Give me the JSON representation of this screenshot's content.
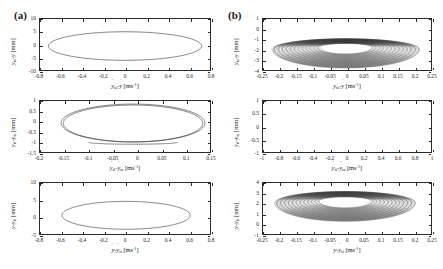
{
  "figure": {
    "top_clipped_text": "m                  n                    o",
    "panels": [
      {
        "label": "(a)",
        "id": "a"
      },
      {
        "label": "(b)",
        "id": "b"
      }
    ]
  },
  "chart_data": [
    {
      "id": "a1",
      "panel": "(a)",
      "type": "line",
      "title": "",
      "xlabel": "ẏ_ta - ẏ [ms⁻¹]",
      "ylabel": "y_ta - y [mm]",
      "xlim": [
        -0.8,
        0.8
      ],
      "ylim": [
        -10,
        10
      ],
      "xticks": [
        -0.8,
        -0.6,
        -0.4,
        -0.2,
        0,
        0.2,
        0.4,
        0.6,
        0.8
      ],
      "xticklabels": [
        "-0.8",
        "-0.6",
        "-0.4",
        "-0.2",
        "0",
        "0.2",
        "0.4",
        "0.6",
        "0.8"
      ],
      "yticks": [
        -10,
        -5,
        0,
        5,
        10
      ],
      "yticklabels": [
        "-10",
        "-5",
        "0",
        "5",
        "10"
      ],
      "grid": false,
      "legend": "none",
      "orbit": {
        "style": "single-ellipse",
        "cx": 0.0,
        "cy": -0.6,
        "rx": 0.74,
        "ry": 5.6,
        "turns": 1,
        "shrink": 1.0
      }
    },
    {
      "id": "a2",
      "panel": "(a)",
      "type": "line",
      "title": "",
      "xlabel": "ẏ_tf - ẏ_ta [ms⁻¹]",
      "ylabel": "y_tf - y_ta [mm]",
      "xlim": [
        -0.2,
        0.15
      ],
      "ylim": [
        -1.5,
        1.0
      ],
      "xticks": [
        -0.2,
        -0.15,
        -0.1,
        -0.05,
        0,
        0.05,
        0.1,
        0.15
      ],
      "xticklabels": [
        "-0.2",
        "-0.15",
        "-0.1",
        "-0.05",
        "0",
        "0.05",
        "0.1",
        "0.15"
      ],
      "yticks": [
        -1.5,
        -1,
        -0.5,
        0,
        0.5,
        1
      ],
      "yticklabels": [
        "-1.5",
        "-1",
        "-0.5",
        "0",
        "0.5",
        "1"
      ],
      "grid": false,
      "legend": "none",
      "orbit": {
        "style": "single-ellipse-flat-bottom",
        "cx": -0.008,
        "cy": -0.08,
        "rx": 0.152,
        "ry": 0.93,
        "turns": 2,
        "shrink": 0.97
      }
    },
    {
      "id": "a3",
      "panel": "(a)",
      "type": "line",
      "title": "",
      "xlabel": "ẏ - ẏ_tf [ms⁻¹]",
      "ylabel": "y - y_tf [mm]",
      "xlim": [
        -0.8,
        0.8
      ],
      "ylim": [
        -5,
        10
      ],
      "xticks": [
        -0.8,
        -0.6,
        -0.4,
        -0.2,
        0,
        0.2,
        0.4,
        0.6,
        0.8
      ],
      "xticklabels": [
        "-0.8",
        "-0.6",
        "-0.4",
        "-0.2",
        "0",
        "0.2",
        "0.4",
        "0.6",
        "0.8"
      ],
      "yticks": [
        -5,
        0,
        5,
        10
      ],
      "yticklabels": [
        "-5",
        "0",
        "5",
        "10"
      ],
      "grid": false,
      "legend": "none",
      "orbit": {
        "style": "single-ellipse",
        "cx": 0.01,
        "cy": 0.5,
        "rx": 0.62,
        "ry": 4.1,
        "turns": 1,
        "shrink": 1.0
      }
    },
    {
      "id": "b1",
      "panel": "(b)",
      "type": "line",
      "title": "",
      "xlabel": "ẏ_ta - ẏ [ms⁻¹]",
      "ylabel": "y_ta - y [mm]",
      "xlim": [
        -0.25,
        0.25
      ],
      "ylim": [
        -4,
        1
      ],
      "xticks": [
        -0.25,
        -0.2,
        -0.15,
        -0.1,
        -0.05,
        0,
        0.05,
        0.1,
        0.15,
        0.2,
        0.25
      ],
      "xticklabels": [
        "-0.25",
        "-0.2",
        "-0.15",
        "-0.1",
        "-0.05",
        "0",
        "0.05",
        "0.1",
        "0.15",
        "0.2",
        "0.25"
      ],
      "yticks": [
        -4,
        -3,
        -2,
        -1,
        0,
        1
      ],
      "yticklabels": [
        "-4",
        "-3",
        "-2",
        "-1",
        "0",
        "1"
      ],
      "grid": false,
      "legend": "none",
      "orbit": {
        "style": "nested-spiral",
        "cx": -0.004,
        "cy": -1.95,
        "rx": 0.225,
        "ry": 1.85,
        "turns": 46,
        "shrink": 0.985,
        "squash_top": 0.55
      }
    },
    {
      "id": "b2",
      "panel": "(b)",
      "type": "line",
      "title": "",
      "xlabel": "ẏ_tf - ẏ_ta [ms⁻¹]",
      "ylabel": "y_tf - y_ta [mm]",
      "xlim": [
        -1.0,
        1.0
      ],
      "ylim": [
        -1.0,
        1.0
      ],
      "xticks": [
        -1,
        -0.8,
        -0.6,
        -0.4,
        -0.2,
        0,
        0.2,
        0.4,
        0.6,
        0.8,
        1
      ],
      "xticklabels": [
        "-1",
        "-0.8",
        "-0.6",
        "-0.4",
        "-0.2",
        "0",
        "0.2",
        "0.4",
        "0.6",
        "0.8",
        "1"
      ],
      "yticks": [
        -1,
        -0.5,
        0,
        0.5,
        1
      ],
      "yticklabels": [
        "-1",
        "-0.5",
        "0",
        "0.5",
        "1"
      ],
      "grid": false,
      "legend": "none",
      "orbit": {
        "style": "empty"
      }
    },
    {
      "id": "b3",
      "panel": "(b)",
      "type": "line",
      "title": "",
      "xlabel": "ẏ - ẏ_tf [ms⁻¹]",
      "ylabel": "y - y_tf [mm]",
      "xlim": [
        -0.25,
        0.25
      ],
      "ylim": [
        -1,
        4
      ],
      "xticks": [
        -0.25,
        -0.2,
        -0.15,
        -0.1,
        -0.05,
        0,
        0.05,
        0.1,
        0.15,
        0.2,
        0.25
      ],
      "xticklabels": [
        "-0.25",
        "-0.2",
        "-0.15",
        "-0.1",
        "-0.05",
        "0",
        "0.05",
        "0.1",
        "0.15",
        "0.2",
        "0.25"
      ],
      "yticks": [
        -1,
        0,
        1,
        2,
        3,
        4
      ],
      "yticklabels": [
        "-1",
        "0",
        "1",
        "2",
        "3",
        "4"
      ],
      "grid": false,
      "legend": "none",
      "orbit": {
        "style": "nested-spiral",
        "cx": -0.006,
        "cy": 2.05,
        "rx": 0.215,
        "ry": 1.8,
        "turns": 44,
        "shrink": 0.985,
        "squash_top": 0.62
      }
    }
  ]
}
